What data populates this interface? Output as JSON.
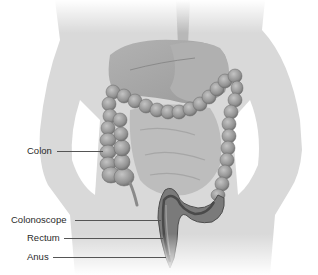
{
  "figure": {
    "labels": [
      {
        "id": "colon",
        "text": "Colon"
      },
      {
        "id": "colonoscope",
        "text": "Colonoscope"
      },
      {
        "id": "rectum",
        "text": "Rectum"
      },
      {
        "id": "anus",
        "text": "Anus"
      }
    ]
  },
  "colors": {
    "background": "#ffffff",
    "body_silhouette": "#d9d9d9",
    "organs": "#a8a8a8",
    "colon": "#8f8f8f",
    "colon_dark": "#5e5e5e",
    "label_text": "#2a2a2a",
    "leader_line": "#555555"
  }
}
